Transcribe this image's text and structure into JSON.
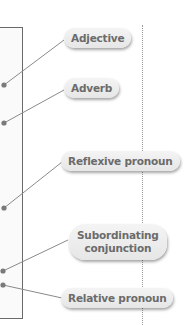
{
  "diagram": {
    "labels": [
      {
        "id": "adjective",
        "text": "Adjective"
      },
      {
        "id": "adverb",
        "text": "Adverb"
      },
      {
        "id": "reflexive-pronoun",
        "text": "Reflexive pronoun"
      },
      {
        "id": "subordinating-conjunction",
        "line1": "Subordinating",
        "line2": "conjunction"
      },
      {
        "id": "relative-pronoun",
        "text": "Relative pronoun"
      }
    ],
    "colors": {
      "pill_text": "#6b6b6b",
      "pill_bg": "#ececec",
      "line": "#8a8a8a",
      "box_border": "#6a6a6a"
    }
  }
}
